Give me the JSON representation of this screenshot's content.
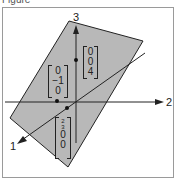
{
  "caption": "Figure",
  "axes": {
    "axis1_label": "1",
    "axis2_label": "2",
    "axis3_label": "3"
  },
  "plane": {
    "fill": "#b8b8b8",
    "stroke": "#222222"
  },
  "points": [
    {
      "name": "point-z",
      "vector": [
        "0",
        "0",
        "4"
      ]
    },
    {
      "name": "point-y",
      "vector": [
        "0",
        "−1",
        "0"
      ]
    },
    {
      "name": "point-x",
      "vector": [
        "2/3",
        "0",
        "0"
      ],
      "fraction_num": "2",
      "fraction_den": "3"
    }
  ]
}
